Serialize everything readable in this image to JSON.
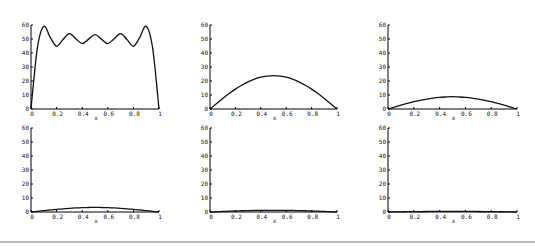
{
  "chart_data": [
    {
      "type": "line",
      "panel": "top-left",
      "title": "",
      "xlabel": "x",
      "ylabel": "",
      "xlim": [
        0,
        1
      ],
      "ylim": [
        0,
        60
      ],
      "xticks": [
        "0",
        "0.2",
        "0.4",
        "0.6",
        "0.8",
        "1"
      ],
      "yticks": [
        "0",
        "10",
        "20",
        "30",
        "40",
        "50",
        "60"
      ],
      "x": [
        0,
        0.05,
        0.1,
        0.15,
        0.2,
        0.25,
        0.3,
        0.35,
        0.4,
        0.45,
        0.5,
        0.55,
        0.6,
        0.65,
        0.7,
        0.75,
        0.8,
        0.85,
        0.9,
        0.95,
        1
      ],
      "series": [
        {
          "name": "u",
          "values": [
            0,
            43.7,
            59.1,
            51.1,
            44.8,
            49.6,
            53.9,
            50.2,
            46.7,
            49.9,
            53.1,
            49.9,
            46.7,
            50.2,
            53.9,
            49.6,
            44.8,
            51.1,
            59.1,
            43.7,
            0
          ]
        }
      ]
    },
    {
      "type": "line",
      "panel": "top-middle",
      "title": "",
      "xlabel": "x",
      "ylabel": "",
      "xlim": [
        0,
        1
      ],
      "ylim": [
        0,
        60
      ],
      "xticks": [
        "0",
        "0.2",
        "0.4",
        "0.6",
        "0.8",
        "1"
      ],
      "yticks": [
        "0",
        "10",
        "20",
        "30",
        "40",
        "50",
        "60"
      ],
      "x": [
        0,
        0.05,
        0.1,
        0.15,
        0.2,
        0.25,
        0.3,
        0.35,
        0.4,
        0.45,
        0.5,
        0.55,
        0.6,
        0.65,
        0.7,
        0.75,
        0.8,
        0.85,
        0.9,
        0.95,
        1
      ],
      "series": [
        {
          "name": "u",
          "values": [
            0,
            3.8,
            7.5,
            11.0,
            14.2,
            17.0,
            19.4,
            21.3,
            22.7,
            23.5,
            23.8,
            23.5,
            22.7,
            21.3,
            19.4,
            17.0,
            14.2,
            11.0,
            7.5,
            3.8,
            0
          ]
        }
      ]
    },
    {
      "type": "line",
      "panel": "top-right",
      "title": "",
      "xlabel": "x",
      "ylabel": "",
      "xlim": [
        0,
        1
      ],
      "ylim": [
        0,
        60
      ],
      "xticks": [
        "0",
        "0.2",
        "0.4",
        "0.6",
        "0.8",
        "1"
      ],
      "yticks": [
        "0",
        "10",
        "20",
        "30",
        "40",
        "50",
        "60"
      ],
      "x": [
        0,
        0.05,
        0.1,
        0.15,
        0.2,
        0.25,
        0.3,
        0.35,
        0.4,
        0.45,
        0.5,
        0.55,
        0.6,
        0.65,
        0.7,
        0.75,
        0.8,
        0.85,
        0.9,
        0.95,
        1
      ],
      "series": [
        {
          "name": "u",
          "values": [
            0,
            1.4,
            2.8,
            4.0,
            5.2,
            6.2,
            7.1,
            7.8,
            8.3,
            8.6,
            8.8,
            8.6,
            8.3,
            7.8,
            7.1,
            6.2,
            5.2,
            4.0,
            2.8,
            1.4,
            0
          ]
        }
      ]
    },
    {
      "type": "line",
      "panel": "bottom-left",
      "title": "",
      "xlabel": "x",
      "ylabel": "",
      "xlim": [
        0,
        1
      ],
      "ylim": [
        0,
        60
      ],
      "xticks": [
        "0",
        "0.2",
        "0.4",
        "0.6",
        "0.8",
        "1"
      ],
      "yticks": [
        "0",
        "10",
        "20",
        "30",
        "40",
        "50",
        "60"
      ],
      "x": [
        0,
        0.05,
        0.1,
        0.15,
        0.2,
        0.25,
        0.3,
        0.35,
        0.4,
        0.45,
        0.5,
        0.55,
        0.6,
        0.65,
        0.7,
        0.75,
        0.8,
        0.85,
        0.9,
        0.95,
        1
      ],
      "series": [
        {
          "name": "u",
          "values": [
            0,
            0.5,
            1.0,
            1.5,
            1.9,
            2.3,
            2.6,
            2.9,
            3.1,
            3.2,
            3.3,
            3.2,
            3.1,
            2.9,
            2.6,
            2.3,
            1.9,
            1.5,
            1.0,
            0.5,
            0
          ]
        }
      ]
    },
    {
      "type": "line",
      "panel": "bottom-middle",
      "title": "",
      "xlabel": "x",
      "ylabel": "",
      "xlim": [
        0,
        1
      ],
      "ylim": [
        0,
        60
      ],
      "xticks": [
        "0",
        "0.2",
        "0.4",
        "0.6",
        "0.8",
        "1"
      ],
      "yticks": [
        "0",
        "10",
        "20",
        "30",
        "40",
        "50",
        "60"
      ],
      "x": [
        0,
        0.05,
        0.1,
        0.15,
        0.2,
        0.25,
        0.3,
        0.35,
        0.4,
        0.45,
        0.5,
        0.55,
        0.6,
        0.65,
        0.7,
        0.75,
        0.8,
        0.85,
        0.9,
        0.95,
        1
      ],
      "series": [
        {
          "name": "u",
          "values": [
            0,
            0.2,
            0.4,
            0.6,
            0.7,
            0.9,
            1.0,
            1.1,
            1.1,
            1.2,
            1.2,
            1.2,
            1.1,
            1.1,
            1.0,
            0.9,
            0.7,
            0.6,
            0.4,
            0.2,
            0
          ]
        }
      ]
    },
    {
      "type": "line",
      "panel": "bottom-right",
      "title": "",
      "xlabel": "x",
      "ylabel": "",
      "xlim": [
        0,
        1
      ],
      "ylim": [
        0,
        60
      ],
      "xticks": [
        "0",
        "0.2",
        "0.4",
        "0.6",
        "0.8",
        "1"
      ],
      "yticks": [
        "0",
        "10",
        "20",
        "30",
        "40",
        "50",
        "60"
      ],
      "x": [
        0,
        0.05,
        0.1,
        0.15,
        0.2,
        0.25,
        0.3,
        0.35,
        0.4,
        0.45,
        0.5,
        0.55,
        0.6,
        0.65,
        0.7,
        0.75,
        0.8,
        0.85,
        0.9,
        0.95,
        1
      ],
      "series": [
        {
          "name": "u",
          "values": [
            0,
            0.07,
            0.14,
            0.2,
            0.26,
            0.31,
            0.36,
            0.39,
            0.42,
            0.44,
            0.45,
            0.44,
            0.42,
            0.39,
            0.36,
            0.31,
            0.26,
            0.2,
            0.14,
            0.07,
            0
          ]
        }
      ]
    }
  ]
}
